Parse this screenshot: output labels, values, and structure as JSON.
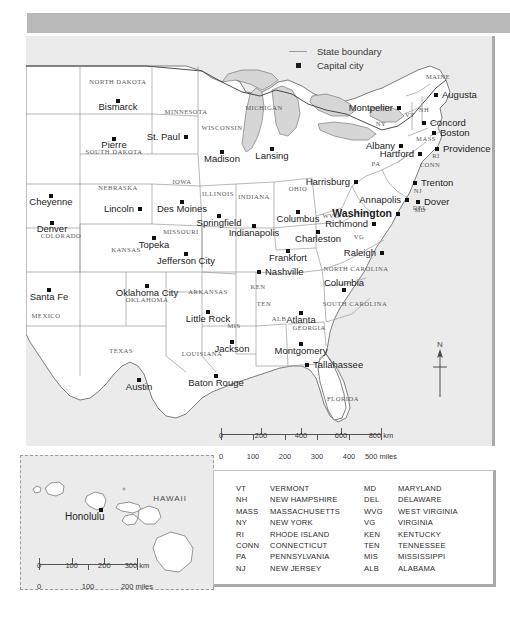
{
  "legend": {
    "items": [
      {
        "key": "line",
        "label": "State boundary"
      },
      {
        "key": "square",
        "label": "Capital city"
      }
    ]
  },
  "north_arrow": {
    "label": "N"
  },
  "scale_main": {
    "km": {
      "ticks": [
        "0",
        "200",
        "400",
        "600",
        "800"
      ],
      "unit": "km"
    },
    "miles": {
      "ticks": [
        "0",
        "100",
        "200",
        "300",
        "400",
        "500"
      ],
      "unit": "miles"
    }
  },
  "hawaii_inset": {
    "region_label": "HAWAII",
    "city": "Honolulu",
    "scale": {
      "km": {
        "ticks": [
          "0",
          "100",
          "200",
          "300"
        ],
        "unit": "km"
      },
      "miles": {
        "ticks": [
          "0",
          "100",
          "200"
        ],
        "unit": "miles"
      }
    }
  },
  "abbreviations": {
    "left": [
      {
        "code": "VT",
        "name": "VERMONT"
      },
      {
        "code": "NH",
        "name": "NEW HAMPSHIRE"
      },
      {
        "code": "MASS",
        "name": "MASSACHUSETTS"
      },
      {
        "code": "NY",
        "name": "NEW YORK"
      },
      {
        "code": "RI",
        "name": "RHODE ISLAND"
      },
      {
        "code": "CONN",
        "name": "CONNECTICUT"
      },
      {
        "code": "PA",
        "name": "PENNSYLVANIA"
      },
      {
        "code": "NJ",
        "name": "NEW JERSEY"
      }
    ],
    "right": [
      {
        "code": "MD",
        "name": "MARYLAND"
      },
      {
        "code": "DEL",
        "name": "DELAWARE"
      },
      {
        "code": "WVG",
        "name": "WEST VIRGINIA"
      },
      {
        "code": "VG",
        "name": "VIRGINIA"
      },
      {
        "code": "KEN",
        "name": "KENTUCKY"
      },
      {
        "code": "TEN",
        "name": "TENNESSEE"
      },
      {
        "code": "MIS",
        "name": "MISSISSIPPI"
      },
      {
        "code": "ALB",
        "name": "ALABAMA"
      }
    ]
  },
  "colors": {
    "ocean": "#ebebeb",
    "land": "#ffffff",
    "lake": "#d6d6d6",
    "boundary": "#9a9a9a",
    "coast": "#4a4a4a",
    "header_band": "#b9b9b9",
    "capital_dot": "#111111"
  },
  "map": {
    "capitals": [
      {
        "name": "Bismarck",
        "x": 92,
        "y": 65,
        "anchor": "middle",
        "dx": 0,
        "dy": 9
      },
      {
        "name": "Pierre",
        "x": 88,
        "y": 103,
        "anchor": "middle",
        "dx": 0,
        "dy": 9
      },
      {
        "name": "St. Paul",
        "x": 160,
        "y": 101,
        "anchor": "end",
        "dx": -6,
        "dy": 3
      },
      {
        "name": "Cheyenne",
        "x": 25,
        "y": 160,
        "anchor": "middle",
        "dx": 0,
        "dy": 9
      },
      {
        "name": "Lincoln",
        "x": 114,
        "y": 173,
        "anchor": "end",
        "dx": -6,
        "dy": 3
      },
      {
        "name": "Des Moines",
        "x": 156,
        "y": 166,
        "anchor": "middle",
        "dx": 0,
        "dy": 10
      },
      {
        "name": "Denver",
        "x": 26,
        "y": 187,
        "anchor": "middle",
        "dx": 0,
        "dy": 9
      },
      {
        "name": "Topeka",
        "x": 128,
        "y": 202,
        "anchor": "middle",
        "dx": 0,
        "dy": 10
      },
      {
        "name": "Jefferson City",
        "x": 160,
        "y": 218,
        "anchor": "middle",
        "dx": 0,
        "dy": 10
      },
      {
        "name": "Madison",
        "x": 196,
        "y": 116,
        "anchor": "middle",
        "dx": 0,
        "dy": 10
      },
      {
        "name": "Lansing",
        "x": 246,
        "y": 113,
        "anchor": "middle",
        "dx": 0,
        "dy": 10
      },
      {
        "name": "Springfield",
        "x": 193,
        "y": 180,
        "anchor": "middle",
        "dx": 0,
        "dy": 10
      },
      {
        "name": "Indianapolis",
        "x": 228,
        "y": 190,
        "anchor": "middle",
        "dx": 0,
        "dy": 10
      },
      {
        "name": "Columbus",
        "x": 272,
        "y": 176,
        "anchor": "middle",
        "dx": 0,
        "dy": 10
      },
      {
        "name": "Frankfort",
        "x": 262,
        "y": 215,
        "anchor": "middle",
        "dx": 0,
        "dy": 10
      },
      {
        "name": "Nashville",
        "x": 233,
        "y": 236,
        "anchor": "start",
        "dx": 6,
        "dy": 3
      },
      {
        "name": "Charleston",
        "x": 292,
        "y": 196,
        "anchor": "middle",
        "dx": 0,
        "dy": 10
      },
      {
        "name": "Harrisburg",
        "x": 330,
        "y": 146,
        "anchor": "end",
        "dx": -6,
        "dy": 3
      },
      {
        "name": "Richmond",
        "x": 348,
        "y": 188,
        "anchor": "end",
        "dx": -6,
        "dy": 3
      },
      {
        "name": "Raleigh",
        "x": 356,
        "y": 217,
        "anchor": "end",
        "dx": -6,
        "dy": 3
      },
      {
        "name": "Columbia",
        "x": 318,
        "y": 254,
        "anchor": "middle",
        "dx": 0,
        "dy": -4
      },
      {
        "name": "Atlanta",
        "x": 275,
        "y": 277,
        "anchor": "middle",
        "dx": 0,
        "dy": 10
      },
      {
        "name": "Montgomery",
        "x": 275,
        "y": 308,
        "anchor": "middle",
        "dx": 0,
        "dy": 10
      },
      {
        "name": "Tallahassee",
        "x": 281,
        "y": 329,
        "anchor": "start",
        "dx": 6,
        "dy": 3
      },
      {
        "name": "Jackson",
        "x": 206,
        "y": 306,
        "anchor": "middle",
        "dx": 0,
        "dy": 10
      },
      {
        "name": "Baton Rouge",
        "x": 190,
        "y": 340,
        "anchor": "middle",
        "dx": 0,
        "dy": 10
      },
      {
        "name": "Little Rock",
        "x": 182,
        "y": 276,
        "anchor": "middle",
        "dx": 0,
        "dy": 10
      },
      {
        "name": "Oklahoma City",
        "x": 121,
        "y": 250,
        "anchor": "middle",
        "dx": 0,
        "dy": 10
      },
      {
        "name": "Austin",
        "x": 113,
        "y": 344,
        "anchor": "middle",
        "dx": 0,
        "dy": 10
      },
      {
        "name": "Santa Fe",
        "x": 23,
        "y": 254,
        "anchor": "middle",
        "dx": 0,
        "dy": 10
      },
      {
        "name": "Montpelier",
        "x": 373,
        "y": 72,
        "anchor": "end",
        "dx": -6,
        "dy": 3
      },
      {
        "name": "Augusta",
        "x": 410,
        "y": 59,
        "anchor": "start",
        "dx": 6,
        "dy": 3
      },
      {
        "name": "Concord",
        "x": 398,
        "y": 87,
        "anchor": "start",
        "dx": 6,
        "dy": 3
      },
      {
        "name": "Boston",
        "x": 408,
        "y": 97,
        "anchor": "start",
        "dx": 6,
        "dy": 3
      },
      {
        "name": "Albany",
        "x": 375,
        "y": 110,
        "anchor": "end",
        "dx": -6,
        "dy": 3
      },
      {
        "name": "Providence",
        "x": 411,
        "y": 113,
        "anchor": "start",
        "dx": 6,
        "dy": 3
      },
      {
        "name": "Hartford",
        "x": 394,
        "y": 118,
        "anchor": "end",
        "dx": -6,
        "dy": 3
      },
      {
        "name": "Trenton",
        "x": 389,
        "y": 147,
        "anchor": "start",
        "dx": 6,
        "dy": 3
      },
      {
        "name": "Dover",
        "x": 392,
        "y": 166,
        "anchor": "start",
        "dx": 6,
        "dy": 3
      },
      {
        "name": "Annapolis",
        "x": 381,
        "y": 164,
        "anchor": "end",
        "dx": -6,
        "dy": 3
      }
    ],
    "national_capital": {
      "name": "Washington",
      "x": 372,
      "y": 178,
      "anchor": "end",
      "dx": -6,
      "dy": 3
    },
    "state_labels": [
      {
        "name": "NORTH DAKOTA",
        "x": 92,
        "y": 48
      },
      {
        "name": "SOUTH DAKOTA",
        "x": 88,
        "y": 118
      },
      {
        "name": "MINNESOTA",
        "x": 160,
        "y": 78
      },
      {
        "name": "WISCONSIN",
        "x": 196,
        "y": 94
      },
      {
        "name": "IOWA",
        "x": 156,
        "y": 148
      },
      {
        "name": "NEBRASKA",
        "x": 92,
        "y": 154
      },
      {
        "name": "COLORADO",
        "x": 35,
        "y": 202
      },
      {
        "name": "KANSAS",
        "x": 100,
        "y": 216
      },
      {
        "name": "MISSOURI",
        "x": 155,
        "y": 198
      },
      {
        "name": "ILLINOIS",
        "x": 192,
        "y": 160
      },
      {
        "name": "INDIANA",
        "x": 228,
        "y": 163
      },
      {
        "name": "OHIO",
        "x": 272,
        "y": 155
      },
      {
        "name": "MICHIGAN",
        "x": 238,
        "y": 74
      },
      {
        "name": "KEN",
        "x": 232,
        "y": 253
      },
      {
        "name": "TEN",
        "x": 238,
        "y": 270
      },
      {
        "name": "OKLAHOMA",
        "x": 121,
        "y": 266
      },
      {
        "name": "ARKANSAS",
        "x": 182,
        "y": 258
      },
      {
        "name": "TEXAS",
        "x": 95,
        "y": 317
      },
      {
        "name": "LOUISIANA",
        "x": 176,
        "y": 320
      },
      {
        "name": "MIS",
        "x": 208,
        "y": 292
      },
      {
        "name": "ALB",
        "x": 253,
        "y": 285
      },
      {
        "name": "GEORGIA",
        "x": 283,
        "y": 294
      },
      {
        "name": "FLORIDA",
        "x": 317,
        "y": 365
      },
      {
        "name": "NORTH CAROLINA",
        "x": 330,
        "y": 235
      },
      {
        "name": "SOUTH CAROLINA",
        "x": 329,
        "y": 270
      },
      {
        "name": "VG",
        "x": 333,
        "y": 203
      },
      {
        "name": "WVG",
        "x": 305,
        "y": 182
      },
      {
        "name": "MD",
        "x": 394,
        "y": 176
      },
      {
        "name": "DEL",
        "x": 394,
        "y": 174
      },
      {
        "name": "NJ",
        "x": 392,
        "y": 157
      },
      {
        "name": "PA",
        "x": 350,
        "y": 130
      },
      {
        "name": "NY",
        "x": 355,
        "y": 90
      },
      {
        "name": "VT",
        "x": 384,
        "y": 81
      },
      {
        "name": "NH",
        "x": 398,
        "y": 76
      },
      {
        "name": "MASS",
        "x": 400,
        "y": 105
      },
      {
        "name": "RI",
        "x": 410,
        "y": 122
      },
      {
        "name": "CONN",
        "x": 404,
        "y": 131
      },
      {
        "name": "MAINE",
        "x": 412,
        "y": 43
      },
      {
        "name": "MEXICO",
        "x": 20,
        "y": 282
      }
    ]
  }
}
